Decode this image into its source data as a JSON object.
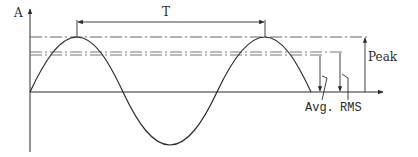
{
  "diagram": {
    "axes": {
      "y_label": "A",
      "x_axis": "time"
    },
    "labels": {
      "period": "T",
      "peak": "Peak",
      "average": "Avg.",
      "rms": "RMS"
    },
    "colors": {
      "stroke": "#2a2a2a",
      "guide": "#555555",
      "background": "#ffffff"
    }
  }
}
